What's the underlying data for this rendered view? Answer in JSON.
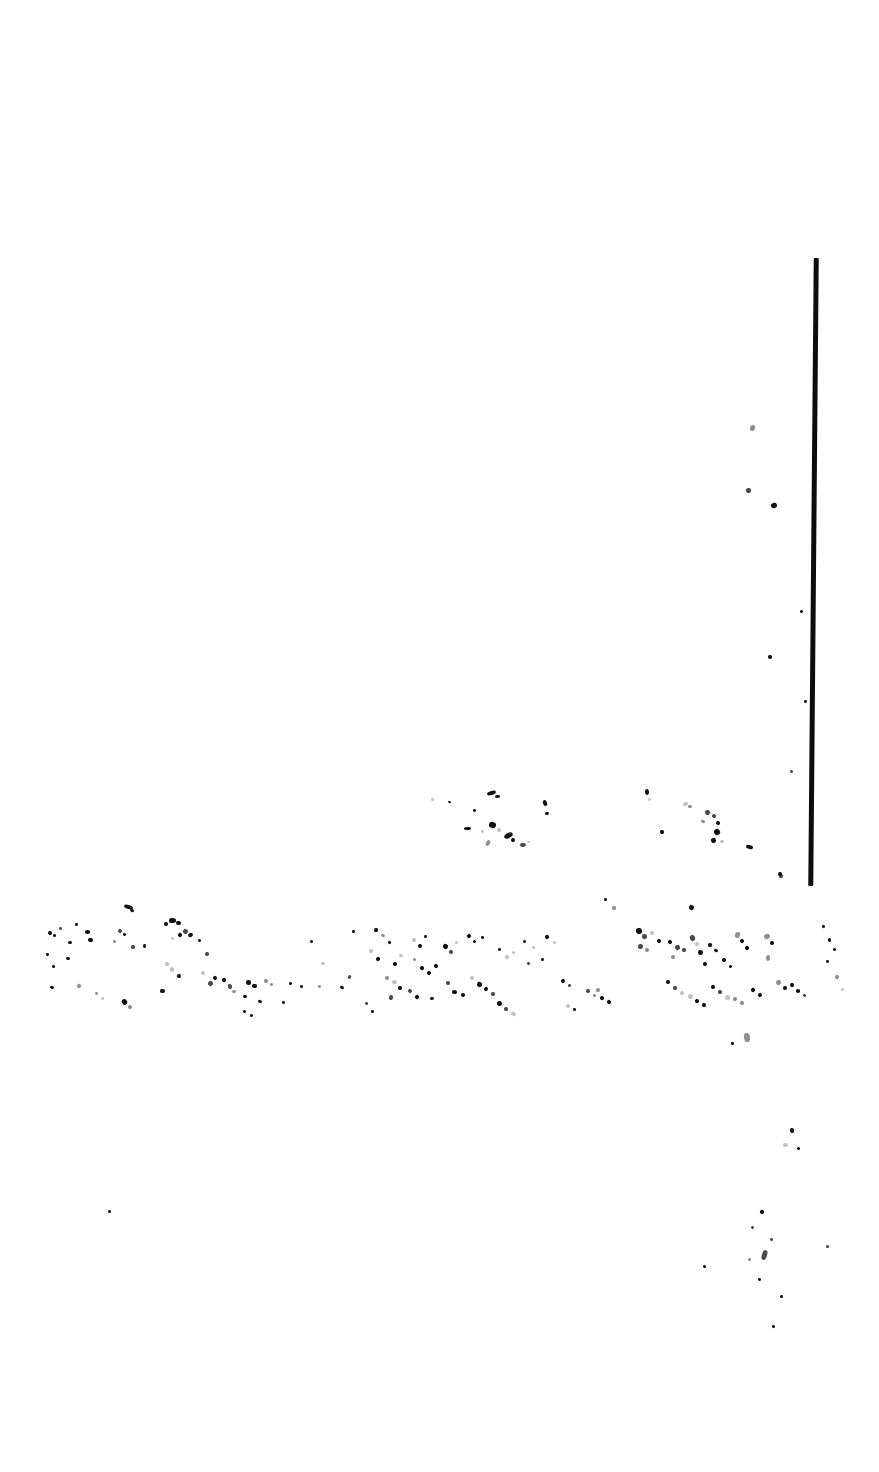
{
  "document": {
    "kind": "scanned-page",
    "condition": "severely-degraded",
    "legible_text": "",
    "page_width": 879,
    "page_height": 1472,
    "background_color": "#ffffff",
    "ink_color": "#111111",
    "note_text": ""
  },
  "rule": {
    "name": "vertical-rule",
    "color": "#0d0d0d",
    "x": 811,
    "y": 258,
    "width": 5,
    "height": 628,
    "skew_deg": 0.5
  },
  "regions": [
    {
      "id": "upper-fragment-band",
      "label": "",
      "x": 420,
      "y": 786,
      "width": 340,
      "height": 72
    },
    {
      "id": "main-fragment-band",
      "label": "",
      "x": 38,
      "y": 900,
      "width": 790,
      "height": 120
    },
    {
      "id": "lower-sparse-marks",
      "label": "",
      "x": 700,
      "y": 1030,
      "width": 170,
      "height": 310
    }
  ],
  "marks": {
    "upper_band": [
      [
        431,
        798,
        3,
        3
      ],
      [
        448,
        801,
        3,
        2
      ],
      [
        487,
        791,
        9,
        4
      ],
      [
        495,
        795,
        5,
        3
      ],
      [
        473,
        809,
        3,
        3
      ],
      [
        543,
        800,
        4,
        6
      ],
      [
        545,
        812,
        4,
        3
      ],
      [
        464,
        827,
        7,
        3
      ],
      [
        481,
        830,
        3,
        3
      ],
      [
        489,
        822,
        7,
        6
      ],
      [
        497,
        828,
        4,
        4
      ],
      [
        504,
        833,
        9,
        5
      ],
      [
        511,
        838,
        4,
        4
      ],
      [
        486,
        840,
        4,
        6
      ],
      [
        520,
        843,
        6,
        4
      ],
      [
        527,
        841,
        3,
        2
      ],
      [
        645,
        789,
        4,
        6
      ],
      [
        648,
        798,
        3,
        3
      ],
      [
        683,
        802,
        5,
        4
      ],
      [
        688,
        805,
        4,
        3
      ],
      [
        705,
        810,
        5,
        5
      ],
      [
        712,
        814,
        4,
        4
      ],
      [
        701,
        820,
        4,
        3
      ],
      [
        716,
        821,
        4,
        4
      ],
      [
        660,
        830,
        4,
        4
      ],
      [
        714,
        829,
        6,
        6
      ],
      [
        711,
        838,
        5,
        5
      ],
      [
        720,
        840,
        4,
        3
      ],
      [
        746,
        845,
        7,
        4
      ],
      [
        779,
        874,
        4,
        4
      ],
      [
        689,
        905,
        5,
        5
      ]
    ],
    "main_band": [
      [
        48,
        931,
        4,
        4
      ],
      [
        53,
        934,
        3,
        3
      ],
      [
        59,
        927,
        3,
        3
      ],
      [
        75,
        923,
        3,
        3
      ],
      [
        85,
        930,
        5,
        4
      ],
      [
        68,
        941,
        4,
        3
      ],
      [
        46,
        953,
        3,
        3
      ],
      [
        66,
        957,
        4,
        3
      ],
      [
        88,
        938,
        5,
        4
      ],
      [
        52,
        965,
        3,
        3
      ],
      [
        50,
        986,
        4,
        3
      ],
      [
        77,
        984,
        4,
        4
      ],
      [
        118,
        929,
        4,
        4
      ],
      [
        123,
        933,
        3,
        3
      ],
      [
        131,
        945,
        4,
        4
      ],
      [
        113,
        940,
        3,
        3
      ],
      [
        143,
        944,
        3,
        4
      ],
      [
        124,
        905,
        9,
        4
      ],
      [
        130,
        909,
        4,
        3
      ],
      [
        169,
        918,
        7,
        5
      ],
      [
        176,
        921,
        5,
        4
      ],
      [
        183,
        929,
        5,
        5
      ],
      [
        188,
        933,
        5,
        4
      ],
      [
        164,
        922,
        4,
        4
      ],
      [
        171,
        937,
        3,
        3
      ],
      [
        178,
        933,
        4,
        4
      ],
      [
        165,
        962,
        4,
        4
      ],
      [
        170,
        967,
        4,
        5
      ],
      [
        177,
        974,
        4,
        4
      ],
      [
        160,
        989,
        5,
        4
      ],
      [
        198,
        939,
        3,
        3
      ],
      [
        205,
        952,
        4,
        4
      ],
      [
        201,
        971,
        4,
        4
      ],
      [
        208,
        981,
        5,
        5
      ],
      [
        213,
        976,
        4,
        4
      ],
      [
        222,
        978,
        4,
        4
      ],
      [
        228,
        984,
        4,
        5
      ],
      [
        232,
        990,
        4,
        3
      ],
      [
        246,
        980,
        5,
        5
      ],
      [
        252,
        984,
        5,
        4
      ],
      [
        243,
        995,
        4,
        3
      ],
      [
        264,
        979,
        4,
        4
      ],
      [
        270,
        983,
        3,
        3
      ],
      [
        258,
        1000,
        4,
        3
      ],
      [
        289,
        982,
        3,
        3
      ],
      [
        300,
        985,
        3,
        3
      ],
      [
        282,
        1001,
        3,
        3
      ],
      [
        310,
        940,
        3,
        3
      ],
      [
        321,
        962,
        4,
        3
      ],
      [
        318,
        985,
        3,
        3
      ],
      [
        340,
        986,
        4,
        3
      ],
      [
        352,
        930,
        3,
        3
      ],
      [
        348,
        975,
        3,
        4
      ],
      [
        374,
        928,
        4,
        4
      ],
      [
        381,
        934,
        4,
        3
      ],
      [
        369,
        949,
        4,
        4
      ],
      [
        376,
        957,
        4,
        4
      ],
      [
        388,
        941,
        3,
        3
      ],
      [
        393,
        962,
        4,
        4
      ],
      [
        399,
        954,
        4,
        3
      ],
      [
        385,
        976,
        4,
        4
      ],
      [
        392,
        980,
        5,
        4
      ],
      [
        398,
        986,
        4,
        4
      ],
      [
        389,
        995,
        4,
        5
      ],
      [
        412,
        938,
        4,
        4
      ],
      [
        418,
        944,
        4,
        4
      ],
      [
        424,
        935,
        3,
        3
      ],
      [
        413,
        958,
        3,
        3
      ],
      [
        420,
        966,
        4,
        4
      ],
      [
        427,
        971,
        4,
        4
      ],
      [
        434,
        964,
        4,
        4
      ],
      [
        408,
        989,
        4,
        4
      ],
      [
        415,
        995,
        4,
        4
      ],
      [
        430,
        997,
        4,
        3
      ],
      [
        443,
        944,
        5,
        5
      ],
      [
        449,
        950,
        4,
        4
      ],
      [
        455,
        941,
        3,
        3
      ],
      [
        446,
        981,
        4,
        4
      ],
      [
        452,
        990,
        5,
        4
      ],
      [
        461,
        993,
        4,
        4
      ],
      [
        467,
        934,
        4,
        4
      ],
      [
        473,
        940,
        3,
        3
      ],
      [
        481,
        936,
        3,
        3
      ],
      [
        470,
        976,
        4,
        4
      ],
      [
        477,
        982,
        5,
        5
      ],
      [
        484,
        987,
        4,
        4
      ],
      [
        491,
        992,
        4,
        4
      ],
      [
        498,
        948,
        3,
        3
      ],
      [
        505,
        955,
        4,
        4
      ],
      [
        512,
        951,
        3,
        3
      ],
      [
        497,
        1001,
        5,
        5
      ],
      [
        504,
        1007,
        4,
        4
      ],
      [
        511,
        1012,
        5,
        4
      ],
      [
        523,
        940,
        3,
        3
      ],
      [
        532,
        946,
        3,
        3
      ],
      [
        527,
        962,
        3,
        3
      ],
      [
        545,
        935,
        4,
        4
      ],
      [
        553,
        941,
        3,
        3
      ],
      [
        541,
        958,
        3,
        3
      ],
      [
        561,
        979,
        4,
        4
      ],
      [
        568,
        984,
        3,
        3
      ],
      [
        586,
        989,
        4,
        4
      ],
      [
        593,
        994,
        3,
        3
      ],
      [
        604,
        898,
        3,
        3
      ],
      [
        612,
        906,
        4,
        4
      ],
      [
        636,
        928,
        6,
        6
      ],
      [
        642,
        934,
        5,
        5
      ],
      [
        638,
        944,
        5,
        5
      ],
      [
        645,
        948,
        4,
        4
      ],
      [
        650,
        931,
        4,
        4
      ],
      [
        657,
        939,
        4,
        4
      ],
      [
        668,
        940,
        4,
        4
      ],
      [
        675,
        945,
        5,
        5
      ],
      [
        682,
        948,
        4,
        4
      ],
      [
        671,
        955,
        4,
        4
      ],
      [
        690,
        935,
        5,
        6
      ],
      [
        695,
        942,
        4,
        4
      ],
      [
        698,
        950,
        5,
        5
      ],
      [
        708,
        943,
        4,
        4
      ],
      [
        714,
        949,
        4,
        3
      ],
      [
        703,
        962,
        4,
        4
      ],
      [
        722,
        958,
        4,
        4
      ],
      [
        729,
        965,
        3,
        3
      ],
      [
        735,
        932,
        5,
        6
      ],
      [
        740,
        939,
        4,
        4
      ],
      [
        745,
        946,
        4,
        4
      ],
      [
        751,
        988,
        4,
        4
      ],
      [
        758,
        993,
        4,
        4
      ],
      [
        666,
        980,
        4,
        4
      ],
      [
        673,
        986,
        4,
        4
      ],
      [
        680,
        991,
        4,
        4
      ],
      [
        688,
        994,
        5,
        5
      ],
      [
        695,
        999,
        4,
        4
      ],
      [
        702,
        1003,
        4,
        4
      ],
      [
        711,
        985,
        4,
        4
      ],
      [
        718,
        990,
        4,
        4
      ],
      [
        725,
        995,
        5,
        5
      ],
      [
        733,
        997,
        4,
        4
      ],
      [
        740,
        1001,
        4,
        4
      ],
      [
        764,
        934,
        6,
        5
      ],
      [
        770,
        941,
        4,
        4
      ],
      [
        766,
        955,
        4,
        6
      ],
      [
        776,
        980,
        5,
        5
      ],
      [
        783,
        986,
        4,
        4
      ],
      [
        790,
        983,
        4,
        4
      ],
      [
        796,
        989,
        4,
        4
      ],
      [
        803,
        994,
        3,
        3
      ],
      [
        822,
        925,
        3,
        3
      ],
      [
        828,
        938,
        3,
        4
      ],
      [
        833,
        948,
        3,
        3
      ],
      [
        826,
        960,
        3,
        3
      ],
      [
        835,
        975,
        4,
        4
      ],
      [
        841,
        988,
        3,
        3
      ],
      [
        596,
        988,
        4,
        4
      ],
      [
        600,
        996,
        4,
        4
      ],
      [
        607,
        1000,
        4,
        4
      ],
      [
        566,
        1004,
        4,
        4
      ],
      [
        573,
        1008,
        3,
        3
      ],
      [
        365,
        1002,
        3,
        3
      ],
      [
        371,
        1010,
        3,
        3
      ],
      [
        243,
        1010,
        3,
        3
      ],
      [
        250,
        1014,
        3,
        3
      ],
      [
        122,
        999,
        5,
        6
      ],
      [
        128,
        1005,
        4,
        4
      ],
      [
        95,
        992,
        3,
        3
      ],
      [
        101,
        997,
        3,
        3
      ]
    ],
    "sparse": [
      [
        750,
        425,
        5,
        6
      ],
      [
        746,
        488,
        5,
        5
      ],
      [
        771,
        503,
        6,
        5
      ],
      [
        768,
        655,
        4,
        4
      ],
      [
        800,
        610,
        3,
        3
      ],
      [
        804,
        700,
        3,
        3
      ],
      [
        790,
        770,
        3,
        3
      ],
      [
        778,
        872,
        4,
        4
      ],
      [
        731,
        1042,
        3,
        3
      ],
      [
        744,
        1033,
        6,
        9
      ],
      [
        790,
        1128,
        4,
        5
      ],
      [
        783,
        1143,
        5,
        4
      ],
      [
        797,
        1147,
        3,
        3
      ],
      [
        108,
        1210,
        3,
        3
      ],
      [
        760,
        1210,
        4,
        4
      ],
      [
        751,
        1226,
        3,
        3
      ],
      [
        762,
        1250,
        5,
        10
      ],
      [
        770,
        1238,
        3,
        3
      ],
      [
        703,
        1265,
        3,
        3
      ],
      [
        748,
        1258,
        3,
        3
      ],
      [
        758,
        1278,
        3,
        3
      ],
      [
        826,
        1245,
        3,
        3
      ],
      [
        772,
        1325,
        3,
        3
      ],
      [
        780,
        1295,
        3,
        3
      ]
    ]
  }
}
